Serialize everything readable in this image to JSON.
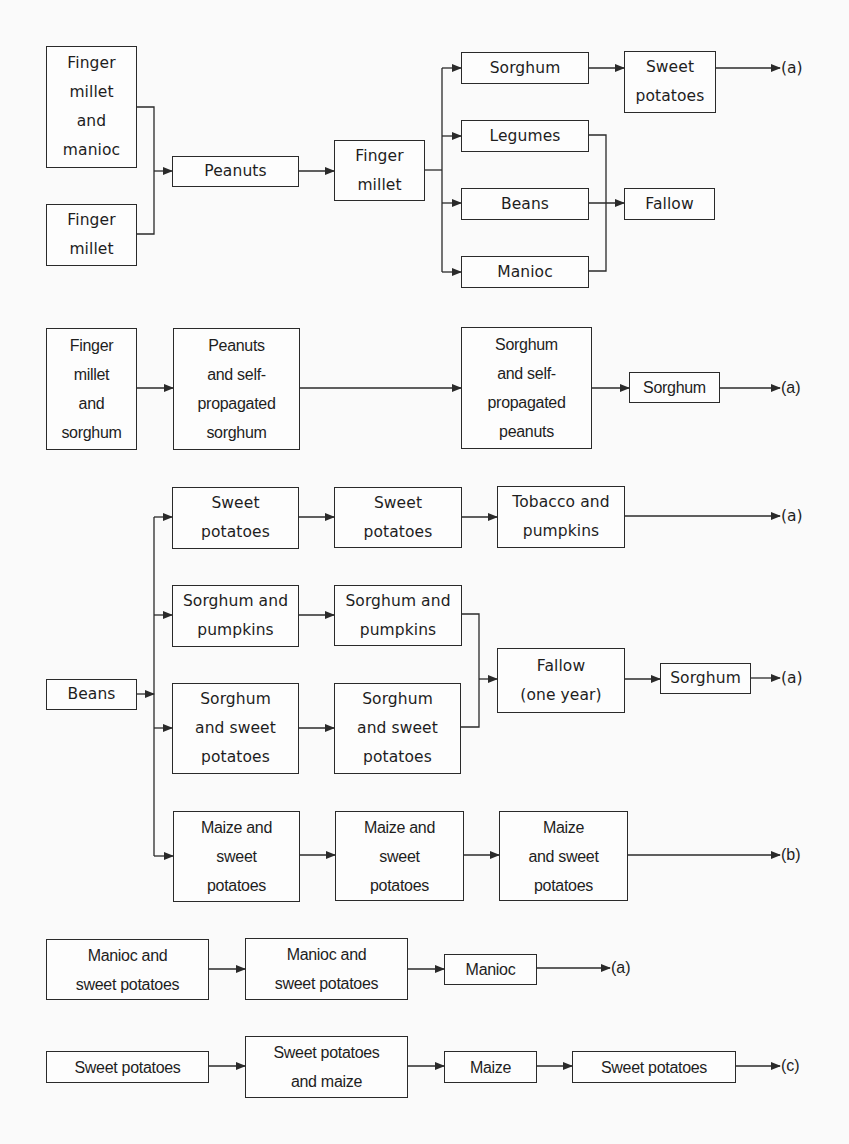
{
  "diagram": {
    "type": "crop rotation flow diagram",
    "line_color": "#2a2a2a",
    "sections": [
      {
        "id": "s1",
        "nodes": [
          {
            "id": "s1n1",
            "label": "Finger\nmillet\nand\nmanioc"
          },
          {
            "id": "s1n2",
            "label": "Finger\nmillet"
          },
          {
            "id": "s1n3",
            "label": "Peanuts"
          },
          {
            "id": "s1n4",
            "label": "Finger\nmillet"
          },
          {
            "id": "s1n5",
            "label": "Sorghum"
          },
          {
            "id": "s1n6",
            "label": "Legumes"
          },
          {
            "id": "s1n7",
            "label": "Beans"
          },
          {
            "id": "s1n8",
            "label": "Manioc"
          },
          {
            "id": "s1n9",
            "label": "Sweet\npotatoes"
          },
          {
            "id": "s1n10",
            "label": "Fallow"
          }
        ],
        "terminals": [
          {
            "id": "s1t1",
            "label": "(a)"
          }
        ],
        "edges": [
          [
            "s1n1",
            "s1n3"
          ],
          [
            "s1n2",
            "s1n3"
          ],
          [
            "s1n3",
            "s1n4"
          ],
          [
            "s1n4",
            "s1n5"
          ],
          [
            "s1n4",
            "s1n6"
          ],
          [
            "s1n4",
            "s1n7"
          ],
          [
            "s1n4",
            "s1n8"
          ],
          [
            "s1n5",
            "s1n9"
          ],
          [
            "s1n9",
            "s1t1"
          ],
          [
            "s1n6",
            "s1n10"
          ],
          [
            "s1n7",
            "s1n10"
          ],
          [
            "s1n8",
            "s1n10"
          ]
        ]
      },
      {
        "id": "s2",
        "nodes": [
          {
            "id": "s2n1",
            "label": "Finger\nmillet\nand\nsorghum"
          },
          {
            "id": "s2n2",
            "label": "Peanuts\nand self-\npropagated\nsorghum"
          },
          {
            "id": "s2n3",
            "label": "Sorghum\nand  self-\npropagated\npeanuts"
          },
          {
            "id": "s2n4",
            "label": "Sorghum"
          }
        ],
        "terminals": [
          {
            "id": "s2t1",
            "label": "(a)"
          }
        ],
        "edges": [
          [
            "s2n1",
            "s2n2"
          ],
          [
            "s2n2",
            "s2n3"
          ],
          [
            "s2n3",
            "s2n4"
          ],
          [
            "s2n4",
            "s2t1"
          ]
        ]
      },
      {
        "id": "s3",
        "nodes": [
          {
            "id": "s3n0",
            "label": "Beans"
          },
          {
            "id": "s3n1",
            "label": "Sweet\npotatoes"
          },
          {
            "id": "s3n2",
            "label": "Sweet\npotatoes"
          },
          {
            "id": "s3n3",
            "label": "Tobacco and\npumpkins"
          },
          {
            "id": "s3n4",
            "label": "Sorghum and\npumpkins"
          },
          {
            "id": "s3n5",
            "label": "Sorghum and\npumpkins"
          },
          {
            "id": "s3n6",
            "label": "Sorghum\nand sweet\npotatoes"
          },
          {
            "id": "s3n7",
            "label": "Sorghum\nand sweet\npotatoes"
          },
          {
            "id": "s3n8",
            "label": "Fallow\n(one year)"
          },
          {
            "id": "s3n9",
            "label": "Sorghum"
          },
          {
            "id": "s3n10",
            "label": "Maize and\nsweet\npotatoes"
          },
          {
            "id": "s3n11",
            "label": "Maize and\nsweet\npotatoes"
          },
          {
            "id": "s3n12",
            "label": "Maize\nand  sweet\npotatoes"
          }
        ],
        "terminals": [
          {
            "id": "s3t1",
            "label": "(a)"
          },
          {
            "id": "s3t2",
            "label": "(a)"
          },
          {
            "id": "s3t3",
            "label": "(b)"
          }
        ],
        "edges": [
          [
            "s3n0",
            "s3n1"
          ],
          [
            "s3n0",
            "s3n4"
          ],
          [
            "s3n0",
            "s3n6"
          ],
          [
            "s3n0",
            "s3n10"
          ],
          [
            "s3n1",
            "s3n2"
          ],
          [
            "s3n2",
            "s3n3"
          ],
          [
            "s3n3",
            "s3t1"
          ],
          [
            "s3n4",
            "s3n5"
          ],
          [
            "s3n6",
            "s3n7"
          ],
          [
            "s3n5",
            "s3n8"
          ],
          [
            "s3n7",
            "s3n8"
          ],
          [
            "s3n8",
            "s3n9"
          ],
          [
            "s3n9",
            "s3t2"
          ],
          [
            "s3n10",
            "s3n11"
          ],
          [
            "s3n11",
            "s3n12"
          ],
          [
            "s3n12",
            "s3t3"
          ]
        ]
      },
      {
        "id": "s4",
        "nodes": [
          {
            "id": "s4n1",
            "label": "Manioc and\nsweet potatoes"
          },
          {
            "id": "s4n2",
            "label": "Manioc and\nsweet  potatoes"
          },
          {
            "id": "s4n3",
            "label": "Manioc"
          }
        ],
        "terminals": [
          {
            "id": "s4t1",
            "label": "(a)"
          }
        ],
        "edges": [
          [
            "s4n1",
            "s4n2"
          ],
          [
            "s4n2",
            "s4n3"
          ],
          [
            "s4n3",
            "s4t1"
          ]
        ]
      },
      {
        "id": "s5",
        "nodes": [
          {
            "id": "s5n1",
            "label": "Sweet  potatoes"
          },
          {
            "id": "s5n2",
            "label": "Sweet potatoes\nand maize"
          },
          {
            "id": "s5n3",
            "label": "Maize"
          },
          {
            "id": "s5n4",
            "label": "Sweet potatoes"
          }
        ],
        "terminals": [
          {
            "id": "s5t1",
            "label": "(c)"
          }
        ],
        "edges": [
          [
            "s5n1",
            "s5n2"
          ],
          [
            "s5n2",
            "s5n3"
          ],
          [
            "s5n3",
            "s5n4"
          ],
          [
            "s5n4",
            "s5t1"
          ]
        ]
      }
    ]
  },
  "labels": {
    "s1": {
      "n1": "Finger\nmillet\nand\nmanioc",
      "n2": "Finger\nmillet",
      "n3": "Peanuts",
      "n4": "Finger\nmillet",
      "n5": "Sorghum",
      "n6": "Legumes",
      "n7": "Beans",
      "n8": "Manioc",
      "n9": "Sweet\npotatoes",
      "n10": "Fallow",
      "t1": "(a)"
    },
    "s2": {
      "n1": "Finger\nmillet\nand\nsorghum",
      "n2": "Peanuts\nand self-\npropagated\nsorghum",
      "n3": "Sorghum\nand  self-\npropagated\npeanuts",
      "n4": "Sorghum",
      "t1": "(a)"
    },
    "s3": {
      "n0": "Beans",
      "n1": "Sweet\npotatoes",
      "n2": "Sweet\npotatoes",
      "n3": "Tobacco and\npumpkins",
      "n4": "Sorghum and\npumpkins",
      "n5": "Sorghum and\npumpkins",
      "n6": "Sorghum\nand sweet\npotatoes",
      "n7": "Sorghum\nand sweet\npotatoes",
      "n8": "Fallow\n(one year)",
      "n9": "Sorghum",
      "n10": "Maize and\nsweet\npotatoes",
      "n11": "Maize and\nsweet\npotatoes",
      "n12": "Maize\nand  sweet\npotatoes",
      "t1": "(a)",
      "t2": "(a)",
      "t3": "(b)"
    },
    "s4": {
      "n1": "Manioc and\nsweet potatoes",
      "n2": "Manioc and\nsweet  potatoes",
      "n3": "Manioc",
      "t1": "(a)"
    },
    "s5": {
      "n1": "Sweet  potatoes",
      "n2": "Sweet potatoes\nand maize",
      "n3": "Maize",
      "n4": "Sweet potatoes",
      "t1": "(c)"
    }
  }
}
